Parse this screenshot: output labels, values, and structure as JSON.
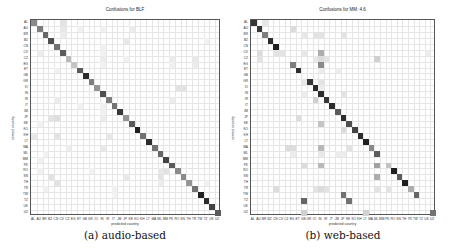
{
  "labels": [
    "AL",
    "AU",
    "BR",
    "BZ",
    "CN",
    "CV",
    "CZ",
    "EG",
    "ET",
    "GB",
    "GR",
    "IO",
    "IN",
    "IR",
    "IT",
    "JM",
    "JP",
    "KE",
    "KO",
    "KH",
    "LT",
    "MA",
    "ML",
    "MM",
    "PK",
    "RO",
    "SN",
    "TH",
    "TR",
    "TW",
    "TZ",
    "UK",
    "UZ"
  ],
  "chart_data": [
    {
      "type": "heatmap",
      "title": "Confusions for BLF",
      "xlabel": "predicted country",
      "ylabel": "correct country",
      "caption": "(a) audio-based",
      "grid": true,
      "categories": [
        "AL",
        "AU",
        "BR",
        "BZ",
        "CN",
        "CV",
        "CZ",
        "EG",
        "ET",
        "GB",
        "GR",
        "IO",
        "IN",
        "IR",
        "IT",
        "JM",
        "JP",
        "KE",
        "KO",
        "KH",
        "LT",
        "MA",
        "ML",
        "MM",
        "PK",
        "RO",
        "SN",
        "TH",
        "TR",
        "TW",
        "TZ",
        "UK",
        "UZ"
      ],
      "diagonal": [
        0.5,
        0.55,
        0.65,
        0.75,
        0.6,
        0.7,
        0.3,
        0.25,
        0.7,
        0.9,
        0.55,
        0.45,
        0.75,
        0.55,
        0.6,
        0.85,
        0.45,
        0.7,
        0.95,
        0.6,
        0.9,
        0.6,
        0.65,
        0.8,
        0.7,
        0.5,
        0.5,
        0.45,
        0.6,
        0.95,
        0.9,
        0.8,
        0.7
      ],
      "off_diagonal": [
        [
          0,
          5,
          0.12
        ],
        [
          1,
          5,
          0.1
        ],
        [
          1,
          8,
          0.06
        ],
        [
          1,
          12,
          0.06
        ],
        [
          1,
          17,
          0.08
        ],
        [
          2,
          5,
          0.08
        ],
        [
          3,
          16,
          0.1
        ],
        [
          3,
          30,
          0.06
        ],
        [
          4,
          12,
          0.06
        ],
        [
          5,
          1,
          0.08
        ],
        [
          5,
          12,
          0.06
        ],
        [
          6,
          12,
          0.08
        ],
        [
          6,
          16,
          0.06
        ],
        [
          6,
          24,
          0.08
        ],
        [
          6,
          28,
          0.1
        ],
        [
          7,
          12,
          0.06
        ],
        [
          7,
          24,
          0.06
        ],
        [
          7,
          28,
          0.08
        ],
        [
          8,
          4,
          0.06
        ],
        [
          11,
          25,
          0.12
        ],
        [
          11,
          26,
          0.12
        ],
        [
          13,
          4,
          0.08
        ],
        [
          13,
          24,
          0.08
        ],
        [
          14,
          8,
          0.06
        ],
        [
          14,
          12,
          0.06
        ],
        [
          15,
          12,
          0.06
        ],
        [
          16,
          3,
          0.12
        ],
        [
          16,
          4,
          0.14
        ],
        [
          16,
          12,
          0.08
        ],
        [
          17,
          1,
          0.06
        ],
        [
          17,
          17,
          0.06
        ],
        [
          19,
          0,
          0.1
        ],
        [
          19,
          4,
          0.12
        ],
        [
          19,
          13,
          0.1
        ],
        [
          21,
          6,
          0.08
        ],
        [
          21,
          12,
          0.1
        ],
        [
          22,
          2,
          0.06
        ],
        [
          23,
          1,
          0.06
        ],
        [
          25,
          1,
          0.06
        ],
        [
          25,
          10,
          0.06
        ],
        [
          25,
          22,
          0.1
        ],
        [
          25,
          23,
          0.12
        ],
        [
          26,
          3,
          0.12
        ],
        [
          26,
          16,
          0.1
        ],
        [
          26,
          22,
          0.12
        ],
        [
          27,
          4,
          0.12
        ],
        [
          27,
          22,
          0.08
        ],
        [
          27,
          30,
          0.06
        ],
        [
          28,
          2,
          0.06
        ],
        [
          28,
          14,
          0.06
        ],
        [
          29,
          14,
          0.05
        ]
      ]
    },
    {
      "type": "heatmap",
      "title": "Confusions for MM: 4.6",
      "xlabel": "predicted country",
      "ylabel": "correct country",
      "caption": "(b) web-based",
      "grid": true,
      "categories": [
        "AL",
        "AU",
        "BR",
        "BZ",
        "CN",
        "CV",
        "CZ",
        "EG",
        "ET",
        "GB",
        "GR",
        "IO",
        "IN",
        "IR",
        "IT",
        "JM",
        "JP",
        "KE",
        "KO",
        "KH",
        "LT",
        "MA",
        "ML",
        "MM",
        "PK",
        "RO",
        "SN",
        "TH",
        "TR",
        "TW",
        "TZ",
        "UK",
        "UZ"
      ],
      "diagonal": [
        0.85,
        0.85,
        0.55,
        0.9,
        0.95,
        0,
        0,
        0,
        0.9,
        0,
        0.85,
        0.9,
        0.9,
        0.85,
        0.9,
        0.7,
        0.9,
        0.75,
        0.8,
        0.9,
        0.95,
        0.5,
        0.7,
        0,
        0,
        0.95,
        0.7,
        0.95,
        0.35,
        0.65,
        0,
        0,
        0.6
      ],
      "off_diagonal": [
        [
          0,
          2,
          0.1
        ],
        [
          1,
          7,
          0.15
        ],
        [
          2,
          9,
          0.1
        ],
        [
          2,
          11,
          0.12
        ],
        [
          2,
          12,
          0.12
        ],
        [
          2,
          16,
          0.12
        ],
        [
          5,
          1,
          0.15
        ],
        [
          5,
          4,
          0.12
        ],
        [
          5,
          5,
          0.12
        ],
        [
          5,
          9,
          0.1
        ],
        [
          5,
          12,
          0.35
        ],
        [
          5,
          31,
          0.08
        ],
        [
          6,
          1,
          0.12
        ],
        [
          6,
          11,
          0.1
        ],
        [
          6,
          12,
          0.15
        ],
        [
          6,
          13,
          0.12
        ],
        [
          6,
          22,
          0.2
        ],
        [
          7,
          7,
          0.55
        ],
        [
          7,
          12,
          0.5
        ],
        [
          8,
          12,
          0.08
        ],
        [
          8,
          15,
          0.08
        ],
        [
          10,
          9,
          0.1
        ],
        [
          10,
          12,
          0.12
        ],
        [
          11,
          12,
          0.08
        ],
        [
          12,
          9,
          0.08
        ],
        [
          12,
          16,
          0.12
        ],
        [
          13,
          11,
          0.2
        ],
        [
          16,
          8,
          0.15
        ],
        [
          17,
          12,
          0.25
        ],
        [
          18,
          16,
          0.15
        ],
        [
          21,
          6,
          0.15
        ],
        [
          21,
          7,
          0.15
        ],
        [
          21,
          12,
          0.3
        ],
        [
          21,
          17,
          0.12
        ],
        [
          22,
          7,
          0.08
        ],
        [
          22,
          12,
          0.1
        ],
        [
          22,
          15,
          0.08
        ],
        [
          22,
          16,
          0.08
        ],
        [
          24,
          9,
          0.15
        ],
        [
          24,
          12,
          0.3
        ],
        [
          24,
          22,
          0.4
        ],
        [
          24,
          24,
          0.25
        ],
        [
          26,
          22,
          0.35
        ],
        [
          28,
          4,
          0.15
        ],
        [
          28,
          11,
          0.12
        ],
        [
          28,
          12,
          0.15
        ],
        [
          28,
          13,
          0.12
        ],
        [
          28,
          22,
          0.12
        ],
        [
          28,
          24,
          0.12
        ],
        [
          29,
          16,
          0.6
        ],
        [
          30,
          9,
          0.65
        ],
        [
          30,
          17,
          0.6
        ],
        [
          32,
          9,
          0.2
        ],
        [
          32,
          20,
          0.2
        ]
      ]
    }
  ]
}
